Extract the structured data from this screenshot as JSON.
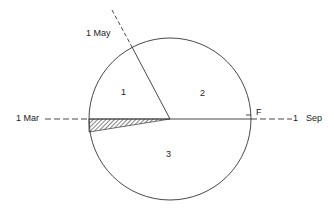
{
  "diagram": {
    "labels": {
      "may": "1   May",
      "mar": "1   Mar",
      "sep": "1   Sep",
      "sep_one": "1",
      "sep_text": "Sep",
      "f": "F",
      "region1": "1",
      "region2": "2",
      "region3": "3"
    },
    "colors": {
      "stroke": "#333333",
      "background": "#ffffff"
    }
  }
}
